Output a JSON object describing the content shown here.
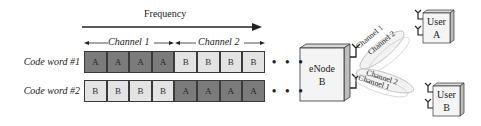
{
  "frequency_axis": {
    "label": "Frequency"
  },
  "channels": [
    {
      "label": "Channel 1"
    },
    {
      "label": "Channel 2"
    }
  ],
  "code_words": [
    {
      "label": "Code word #1",
      "cells": [
        "A",
        "A",
        "A",
        "A",
        "B",
        "B",
        "B",
        "B"
      ]
    },
    {
      "label": "Code word #2",
      "cells": [
        "B",
        "B",
        "B",
        "B",
        "A",
        "A",
        "A",
        "A"
      ]
    }
  ],
  "continuation": "• • •",
  "enodeb": {
    "line1": "eNode",
    "line2": "B"
  },
  "links": [
    {
      "target": "User A",
      "labels": [
        "Channel 1",
        "Channel 2"
      ]
    },
    {
      "target": "User B",
      "labels": [
        "Channel 2",
        "Channel 1"
      ]
    }
  ],
  "users": [
    {
      "line1": "User",
      "line2": "A"
    },
    {
      "line1": "User",
      "line2": "B"
    }
  ],
  "colors": {
    "cell_a": "#7b7b7b",
    "cell_b": "#e3e3e3",
    "border": "#3a3a3a"
  }
}
